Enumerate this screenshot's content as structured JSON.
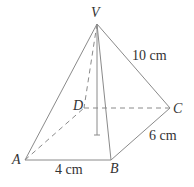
{
  "diagram": {
    "type": "rectangular-pyramid",
    "vertices": {
      "apex": "V",
      "base": [
        "A",
        "B",
        "C",
        "D"
      ]
    },
    "labels": {
      "V": "V",
      "A": "A",
      "B": "B",
      "C": "C",
      "D": "D"
    },
    "measurements": {
      "AB": "4 cm",
      "BC": "6 cm",
      "VC": "10 cm"
    },
    "colors": {
      "lines": "#8a8a8a",
      "text": "#333333",
      "background": "#ffffff"
    }
  }
}
